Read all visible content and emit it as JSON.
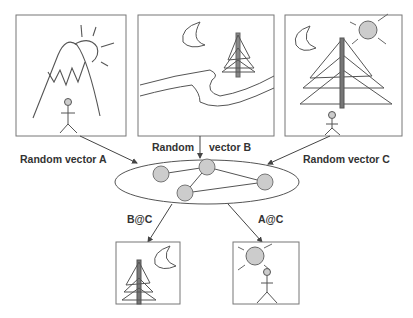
{
  "diagram": {
    "inputs": [
      {
        "id": "A",
        "description": "mountain with sun and stick figure"
      },
      {
        "id": "B",
        "description": "river landscape with moon and tree"
      },
      {
        "id": "C",
        "description": "large tree with moon, sun and stick figure"
      }
    ],
    "labels": {
      "vector_a": "Random vector A",
      "vector_b_left": "Random",
      "vector_b_right": "vector B",
      "vector_c": "Random vector C",
      "output_bc": "B@C",
      "output_ac": "A@C"
    },
    "outputs": [
      {
        "id": "B@C",
        "description": "tree with moon"
      },
      {
        "id": "A@C",
        "description": "sun with stick figure"
      }
    ],
    "memory_nodes": 4,
    "colors": {
      "stroke": "#555555",
      "node_fill": "#cccccc",
      "text": "#333333"
    }
  }
}
